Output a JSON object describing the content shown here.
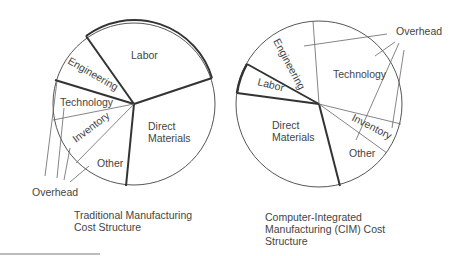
{
  "colors": {
    "ink": "#444444",
    "background": "#ffffff",
    "thick_line": "#333333"
  },
  "traditional": {
    "caption_line1": "Traditional Manufacturing",
    "caption_line2": "Cost Structure",
    "segments": {
      "labor": "Labor",
      "engineering": "Engineering",
      "technology": "Technology",
      "inventory": "Inventory",
      "other": "Other",
      "direct_materials_1": "Direct",
      "direct_materials_2": "Materials"
    },
    "overhead_label": "Overhead"
  },
  "cim": {
    "caption_line1": "Computer-Integrated",
    "caption_line2": "Manufacturing (CIM) Cost",
    "caption_line3": "Structure",
    "segments": {
      "labor": "Labor",
      "engineering": "Engineering",
      "technology": "Technology",
      "inventory": "Inventory",
      "other": "Other",
      "direct_materials_1": "Direct",
      "direct_materials_2": "Materials"
    },
    "overhead_label": "Overhead"
  }
}
